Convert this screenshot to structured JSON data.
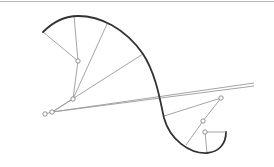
{
  "diagram": {
    "colors": {
      "curve": "#333333",
      "construction": "#9a9a9a",
      "joint_fill": "#ffffff",
      "joint_stroke": "#777777",
      "border": "#b8b8b8",
      "background": "#ffffff"
    },
    "curve_path": "M43,32 C55,20 68,16 78,16 C100,16 125,28 143,54 C156,74 160,100 164,118 C170,140 190,154 207,153 C218,152 226,145 226,132",
    "closing_segment": {
      "x1": 226,
      "y1": 132,
      "x2": 205,
      "y2": 132
    },
    "joints": [
      {
        "id": "j1",
        "x": 78,
        "y": 61
      },
      {
        "id": "j2",
        "x": 73,
        "y": 99
      },
      {
        "id": "j3",
        "x": 52,
        "y": 112
      },
      {
        "id": "j4",
        "x": 45,
        "y": 114
      },
      {
        "id": "j5",
        "x": 221,
        "y": 98
      },
      {
        "id": "j6",
        "x": 203,
        "y": 121
      },
      {
        "id": "j7",
        "x": 205,
        "y": 132
      }
    ],
    "segments": [
      {
        "x1": 43,
        "y1": 32,
        "x2": 78,
        "y2": 61
      },
      {
        "x1": 74,
        "y1": 16,
        "x2": 78,
        "y2": 61
      },
      {
        "x1": 78,
        "y1": 61,
        "x2": 73,
        "y2": 99
      },
      {
        "x1": 107,
        "y1": 24,
        "x2": 73,
        "y2": 99
      },
      {
        "x1": 73,
        "y1": 99,
        "x2": 52,
        "y2": 112
      },
      {
        "x1": 143,
        "y1": 54,
        "x2": 52,
        "y2": 112
      },
      {
        "x1": 52,
        "y1": 112,
        "x2": 254,
        "y2": 83
      },
      {
        "x1": 52,
        "y1": 112,
        "x2": 254,
        "y2": 86
      },
      {
        "x1": 45,
        "y1": 114,
        "x2": 52,
        "y2": 112
      },
      {
        "x1": 164,
        "y1": 116,
        "x2": 221,
        "y2": 98
      },
      {
        "x1": 221,
        "y1": 98,
        "x2": 203,
        "y2": 121
      },
      {
        "x1": 203,
        "y1": 121,
        "x2": 186,
        "y2": 145
      },
      {
        "x1": 205,
        "y1": 132,
        "x2": 207,
        "y2": 153
      }
    ]
  }
}
